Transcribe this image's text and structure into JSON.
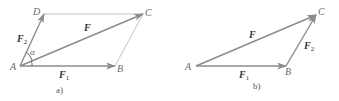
{
  "colors": {
    "vector": "#8c8c8c",
    "thin_line": "#b5b5b5",
    "label": "#6b6b6b",
    "vector_label": "#333333"
  },
  "diagram_a": {
    "caption": "a)",
    "points": {
      "A": "A",
      "B": "B",
      "C": "C",
      "D": "D"
    },
    "vectors": {
      "F": {
        "base": "F",
        "sub": ""
      },
      "F1": {
        "base": "F",
        "sub": "1"
      },
      "F2": {
        "base": "F",
        "sub": "2"
      }
    },
    "angle": "α"
  },
  "diagram_b": {
    "caption": "b)",
    "points": {
      "A": "A",
      "B": "B",
      "C": "C"
    },
    "vectors": {
      "F": {
        "base": "F",
        "sub": ""
      },
      "F1": {
        "base": "F",
        "sub": "1"
      },
      "F2": {
        "base": "F",
        "sub": "2"
      }
    }
  }
}
